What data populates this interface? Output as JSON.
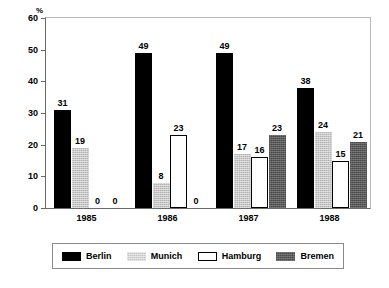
{
  "chart_data": {
    "type": "bar",
    "title": "",
    "subtitle": "",
    "xlabel": "",
    "ylabel": "%",
    "unit_caption": "%",
    "ylim": [
      0,
      60
    ],
    "ytick_step": 10,
    "yticks": [
      60,
      50,
      40,
      30,
      20,
      10,
      0
    ],
    "grid": false,
    "legend_position": "bottom",
    "categories": [
      "1985",
      "1986",
      "1987",
      "1988"
    ],
    "series": [
      {
        "name": "Berlin",
        "color": "#000000",
        "style": "solid-black",
        "values": [
          31,
          49,
          49,
          38
        ]
      },
      {
        "name": "Munich",
        "color": "#b3b3b3",
        "style": "light-gray-stipple",
        "values": [
          19,
          8,
          17,
          24
        ]
      },
      {
        "name": "Hamburg",
        "color": "#ffffff",
        "style": "white-outline",
        "values": [
          0,
          23,
          16,
          15
        ]
      },
      {
        "name": "Bremen",
        "color": "#5c5c5c",
        "style": "dark-gray-stipple",
        "values": [
          0,
          0,
          23,
          21
        ]
      }
    ],
    "data_labels": {
      "1985": {
        "Berlin": "31",
        "Munich": "19",
        "Hamburg": "0",
        "Bremen": "0"
      },
      "1986": {
        "Berlin": "49",
        "Munich": "8",
        "Hamburg": "23",
        "Bremen": "0"
      },
      "1987": {
        "Berlin": "49",
        "Munich": "17",
        "Hamburg": "16",
        "Bremen": "23"
      },
      "1988": {
        "Berlin": "38",
        "Munich": "24",
        "Hamburg": "15",
        "Bremen": "21"
      }
    }
  },
  "axis": {
    "y_unit": "%",
    "y_labels": [
      "60",
      "50",
      "40",
      "30",
      "20",
      "10",
      "0"
    ],
    "x_labels": [
      "1985",
      "1986",
      "1987",
      "1988"
    ]
  },
  "legend": {
    "items": [
      {
        "label": "Berlin"
      },
      {
        "label": "Munich"
      },
      {
        "label": "Hamburg"
      },
      {
        "label": "Bremen"
      }
    ]
  }
}
